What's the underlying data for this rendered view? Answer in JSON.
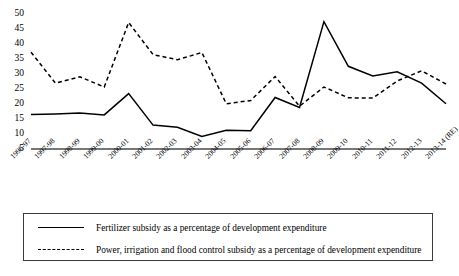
{
  "chart_data": {
    "type": "line",
    "title": "",
    "subtitle": "",
    "xlabel": "",
    "ylabel": "",
    "grid": false,
    "legend_position": "bottom",
    "ylim": [
      5,
      50
    ],
    "yticks": [
      5,
      10,
      15,
      20,
      25,
      30,
      35,
      40,
      45,
      50
    ],
    "categories": [
      "1996-97",
      "1997-98",
      "1998-99",
      "1999-00",
      "2000-01",
      "2001-02",
      "2002-03",
      "2003-04",
      "2004-05",
      "2005-06",
      "2006-07",
      "2007-08",
      "2008-09",
      "2009-10",
      "2010-11",
      "2011-12",
      "2012-13",
      "2013-14 (RE)"
    ],
    "series": [
      {
        "name": "Fertilizer subsidy as a percentage of development expenditure",
        "style": "solid",
        "color": "#000000",
        "values": [
          16.3,
          16.5,
          16.8,
          16.2,
          23.3,
          12.8,
          12.1,
          9.0,
          11.1,
          10.9,
          22.0,
          18.7,
          47.3,
          32.4,
          29.2,
          30.6,
          26.8,
          19.9
        ]
      },
      {
        "name": "Power, irrigation and flood control subsidy as a percentage of development expenditure",
        "style": "dashed",
        "color": "#000000",
        "values": [
          37.1,
          26.8,
          28.9,
          25.5,
          47.0,
          36.3,
          34.6,
          37.0,
          19.9,
          21.0,
          29.0,
          19.1,
          25.5,
          21.9,
          21.8,
          27.5,
          30.9,
          26.5
        ]
      }
    ]
  },
  "legend": {
    "items": [
      {
        "label": "Fertilizer subsidy as a percentage of development expenditure",
        "style": "solid"
      },
      {
        "label": "Power, irrigation and flood control subsidy as a percentage of development expenditure",
        "style": "dashed"
      }
    ]
  }
}
